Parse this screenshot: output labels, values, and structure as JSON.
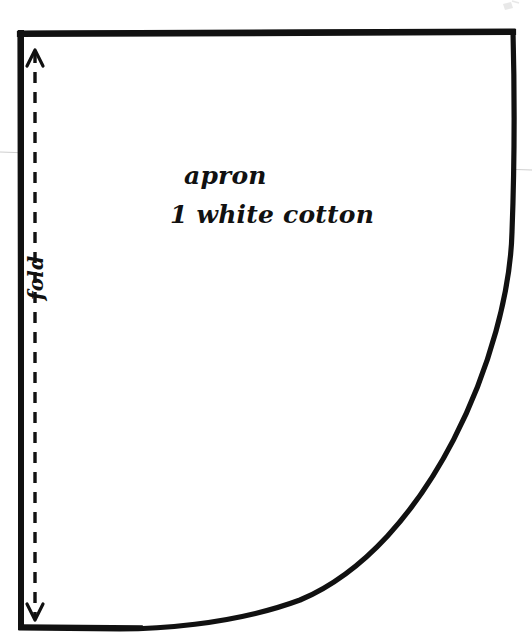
{
  "document": {
    "kind": "sewing-pattern-piece",
    "background_color": "#ffffff",
    "ink_color": "#111111",
    "scan_line_color": "#cfcfcf",
    "width": 532,
    "height": 641
  },
  "pattern": {
    "piece_name": "apron",
    "material_note": "1 white cotton",
    "fold_label": "fold",
    "outline_color": "#111111",
    "outline_width": 5,
    "fold_line_color": "#111111",
    "fold_line_width": 3,
    "fold_line_dash": "11 9"
  },
  "geometry": {
    "top_left": [
      20,
      32
    ],
    "top_right": [
      513,
      31
    ],
    "bottom_left": [
      21,
      626
    ],
    "right_edge_bottom": [
      512,
      232
    ],
    "curve_control_1": [
      509,
      430
    ],
    "curve_control_2": [
      330,
      624
    ],
    "curve_end": [
      120,
      629
    ],
    "fold_axis_x": 35,
    "fold_arrow_top_y": 52,
    "fold_arrow_bottom_y": 618
  },
  "scan_artifact": {
    "line_left": [
      0,
      152
    ],
    "line_right": [
      532,
      170
    ],
    "visible": true
  }
}
